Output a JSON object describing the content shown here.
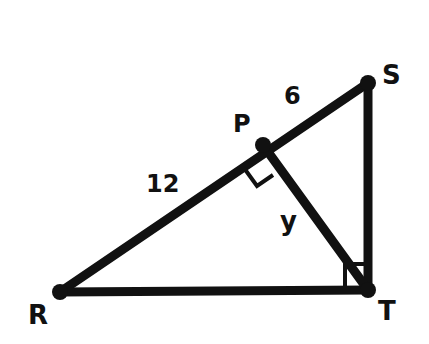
{
  "diagram": {
    "type": "geometry-right-triangle",
    "points": {
      "R": {
        "label": "R",
        "x": 60,
        "y": 292
      },
      "S": {
        "label": "S",
        "x": 368,
        "y": 83
      },
      "T": {
        "label": "T",
        "x": 368,
        "y": 290
      },
      "P": {
        "label": "P",
        "x": 263,
        "y": 145
      }
    },
    "segments": [
      {
        "from": "R",
        "to": "S"
      },
      {
        "from": "S",
        "to": "T"
      },
      {
        "from": "R",
        "to": "T"
      },
      {
        "from": "P",
        "to": "T"
      }
    ],
    "measures": {
      "PS": "6",
      "RP": "12",
      "PT": "y"
    },
    "right_angles": [
      "P",
      "T"
    ],
    "stroke_color": "#111111"
  }
}
